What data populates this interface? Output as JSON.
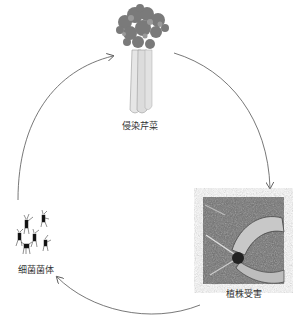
{
  "diagram": {
    "type": "cycle",
    "nodes": [
      {
        "id": "celery",
        "label": "侵染芹菜",
        "image": "celery-plant"
      },
      {
        "id": "damaged",
        "label": "植株受害",
        "image": "damaged-plant-photo"
      },
      {
        "id": "bacteria",
        "label": "细菌菌体",
        "image": "bacteria-cells"
      }
    ],
    "edges": [
      {
        "from": "celery",
        "to": "damaged"
      },
      {
        "from": "damaged",
        "to": "bacteria"
      },
      {
        "from": "bacteria",
        "to": "celery"
      }
    ]
  },
  "colors": {
    "arrow": "#555555",
    "text": "#333333"
  }
}
